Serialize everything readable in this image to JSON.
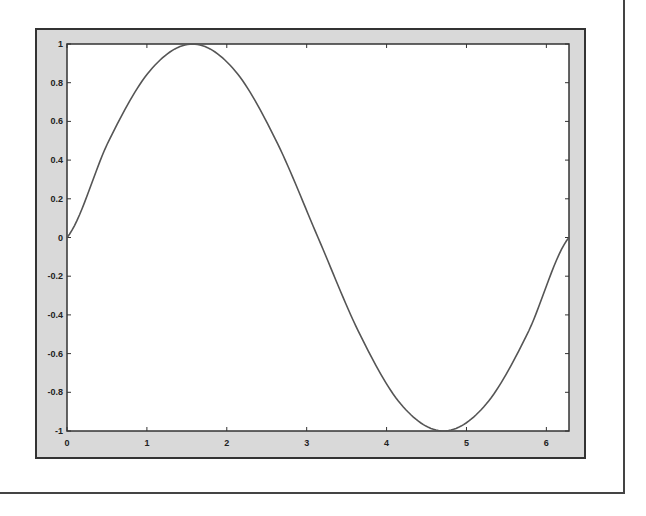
{
  "chart_data": {
    "type": "line",
    "title": "",
    "xlabel": "",
    "ylabel": "",
    "xlim": [
      0,
      6.2832
    ],
    "ylim": [
      -1,
      1
    ],
    "grid": false,
    "legend": null,
    "x_ticks": [
      "0",
      "1",
      "2",
      "3",
      "4",
      "5",
      "6"
    ],
    "y_ticks": [
      "1",
      "0.8",
      "0.6",
      "0.4",
      "0.2",
      "0",
      "-0.2",
      "-0.4",
      "-0.6",
      "-0.8",
      "-1"
    ],
    "series": [
      {
        "name": "sin(x)",
        "color": "#555555",
        "x": [
          0,
          0.5236,
          1.0472,
          1.5708,
          2.0944,
          2.618,
          3.1416,
          3.6652,
          4.1888,
          4.7124,
          5.236,
          5.7596,
          6.2832
        ],
        "values": [
          0,
          0.5,
          0.866,
          1,
          0.866,
          0.5,
          0,
          -0.5,
          -0.866,
          -1,
          -0.866,
          -0.5,
          0
        ]
      }
    ]
  },
  "colors": {
    "panel_bg": "#d9d9d9",
    "plot_bg": "#ffffff",
    "axes": "#333333",
    "line": "#555555"
  }
}
